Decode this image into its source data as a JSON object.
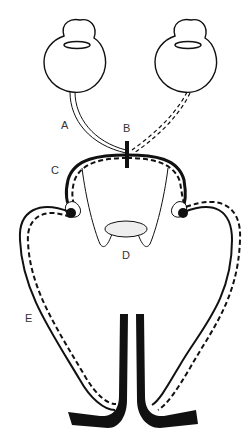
{
  "diagram": {
    "labels": {
      "A": "A",
      "B": "B",
      "C": "C",
      "D": "D",
      "E": "E"
    },
    "legend_styles": {
      "left_pathway": "solid double line",
      "right_pathway": "dashed double line"
    },
    "colors": {
      "stroke": "#111111",
      "fill_d": "#eeeeee",
      "background": "#ffffff",
      "label_text": "#333333"
    }
  }
}
